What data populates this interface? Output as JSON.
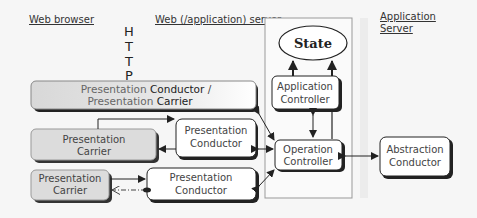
{
  "labels": {
    "web_browser": "Web browser",
    "web_server": "Web (/application) server",
    "app_server_line1": "Application",
    "app_server_line2": "Server",
    "http": [
      "H",
      "T",
      "T",
      "P"
    ]
  },
  "nodes": {
    "state": {
      "label": "State"
    },
    "application_controller": {
      "line1": "Application",
      "line2": "Controller"
    },
    "top_conductor_carrier": {
      "line1_a": "Presentation ",
      "line1_b": "Conductor",
      "line1_c": " /",
      "line2_a": "Presentation ",
      "line2_b": "Carrier"
    },
    "carrier_mid": {
      "line1": "Presentation",
      "line2": "Carrier"
    },
    "conductor_mid": {
      "line1": "Presentation",
      "line2": "Conductor"
    },
    "operation_controller": {
      "line1": "Operation",
      "line2": "Controller"
    },
    "abstraction_conductor": {
      "line1": "Abstraction",
      "line2": "Conductor"
    },
    "carrier_bottom": {
      "line1": "Presentation",
      "line2": "Carrier"
    },
    "conductor_bottom": {
      "line1": "Presentation",
      "line2": "Conductor"
    }
  },
  "colors": {
    "background": "#f6f6f6",
    "box_white": "#ffffff",
    "box_gray": "#dcdcdc",
    "stroke": "#222222",
    "server_frame": "#999999"
  }
}
